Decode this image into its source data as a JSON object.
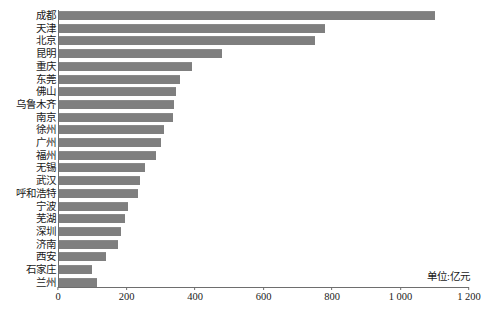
{
  "chart_data": {
    "type": "bar",
    "orientation": "horizontal",
    "title": "",
    "xlabel": "",
    "ylabel": "",
    "unit_note": "单位:亿元",
    "xlim": [
      0,
      1200
    ],
    "grid": false,
    "legend": null,
    "bar_color": "#7f7f7f",
    "xticks": [
      "0",
      "200",
      "400",
      "600",
      "800",
      "1 000",
      "1 200"
    ],
    "xtick_values": [
      0,
      200,
      400,
      600,
      800,
      1000,
      1200
    ],
    "categories": [
      "成都",
      "天津",
      "北京",
      "昆明",
      "重庆",
      "东莞",
      "佛山",
      "乌鲁木齐",
      "南京",
      "徐州",
      "广州",
      "福州",
      "无锡",
      "武汉",
      "呼和浩特",
      "宁波",
      "芜湖",
      "深圳",
      "济南",
      "西安",
      "石家庄",
      "兰州"
    ],
    "values": [
      1100,
      780,
      750,
      480,
      390,
      355,
      345,
      340,
      335,
      310,
      300,
      285,
      255,
      240,
      235,
      205,
      195,
      185,
      175,
      140,
      100,
      115
    ]
  }
}
